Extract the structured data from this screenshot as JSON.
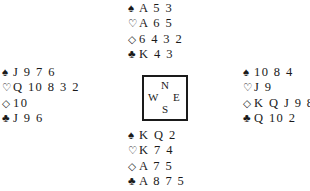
{
  "suit_symbols": {
    "spades": "♠",
    "hearts": "♡",
    "diamonds": "◇",
    "clubs": "♣"
  },
  "hands": {
    "north": {
      "spades": "A 5 3",
      "hearts": "A 6 5",
      "diamonds": "6 4 3 2",
      "clubs": "K 4 3"
    },
    "west": {
      "spades": "J 9 7 6",
      "hearts": "Q 10 8 3 2",
      "diamonds": "10",
      "clubs": "J 9 6"
    },
    "east": {
      "spades": "10 8 4",
      "hearts": "J 9",
      "diamonds": "K Q J 9 8",
      "clubs": "Q 10 2"
    },
    "south": {
      "spades": "K Q 2",
      "hearts": "K 7 4",
      "diamonds": "A 7 5",
      "clubs": "A 8 7 5"
    }
  },
  "compass": {
    "north": "N",
    "west": "W",
    "east": "E",
    "south": "S"
  }
}
